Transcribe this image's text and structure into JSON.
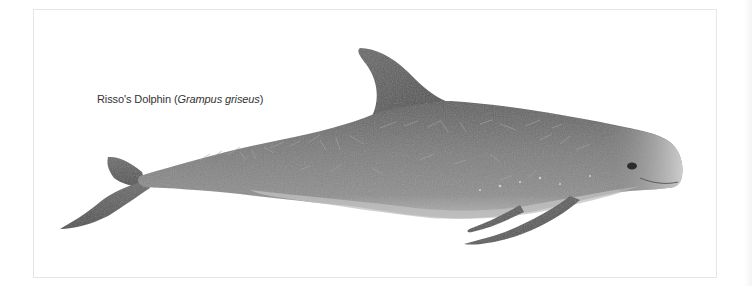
{
  "figure": {
    "caption": {
      "common_name": "Risso's Dolphin",
      "open_paren": " (",
      "scientific_name": "Grampus griseus",
      "close_paren": ")"
    },
    "colors": {
      "frame_border": "#e6e6e6",
      "body_dark": "#6d6d6d",
      "body_mid": "#8a8a8a",
      "belly_light": "#b9b9b9",
      "head_light": "#c8c8c8",
      "fin_dark": "#5a5a5a"
    }
  }
}
